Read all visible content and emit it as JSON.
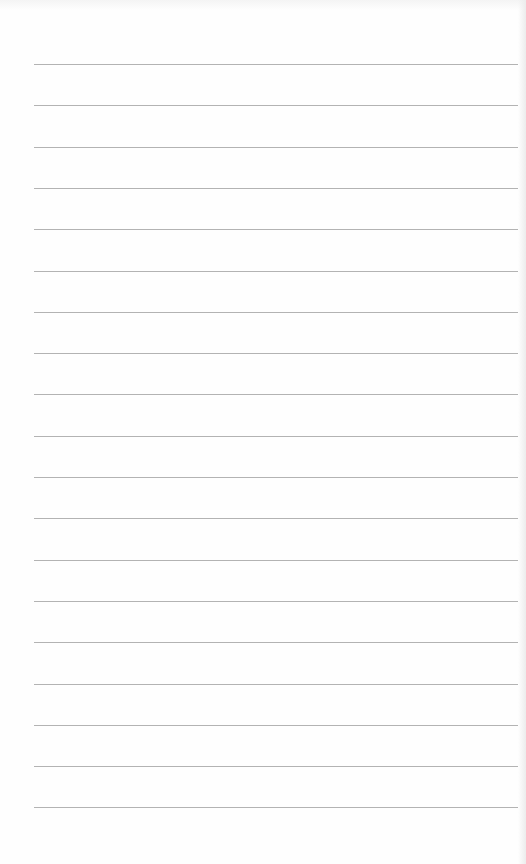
{
  "page": {
    "type": "lined-paper",
    "background": "#fefefe",
    "rule_color": "#9a9a9a",
    "rule_count": 19,
    "first_rule_y": 64,
    "rule_spacing": 41.3,
    "rule_left": 34,
    "rule_width": 484
  }
}
